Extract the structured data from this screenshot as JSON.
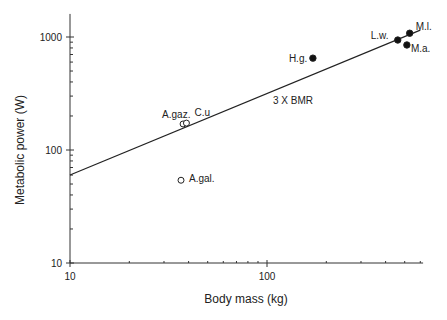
{
  "chart_data": {
    "type": "scatter",
    "title": "",
    "xlabel": "Body mass (kg)",
    "ylabel": "Metabolic power (W)",
    "xscale": "log",
    "yscale": "log",
    "xlim": [
      10,
      620
    ],
    "ylim": [
      10,
      1600
    ],
    "x_ticks": [
      10,
      100
    ],
    "y_ticks": [
      10,
      100,
      1000
    ],
    "x_tick_labels": [
      "10",
      "100"
    ],
    "y_tick_labels": [
      "10",
      "100",
      "1000"
    ],
    "grid": false,
    "series": [
      {
        "name": "open",
        "marker": "open-circle",
        "points": [
          {
            "label": "A.gaz.",
            "x": 37.5,
            "y": 170
          },
          {
            "label": "C.u",
            "x": 39,
            "y": 173
          },
          {
            "label": "A.gal.",
            "x": 36.6,
            "y": 54
          }
        ]
      },
      {
        "name": "filled",
        "marker": "filled-circle",
        "points": [
          {
            "label": "H.g.",
            "x": 171,
            "y": 650
          },
          {
            "label": "L.w.",
            "x": 461,
            "y": 940
          },
          {
            "label": "M.a.",
            "x": 513,
            "y": 850
          },
          {
            "label": "M.l.",
            "x": 530,
            "y": 1080
          }
        ]
      }
    ],
    "reference_line": {
      "label": "3 X BMR",
      "points": [
        {
          "x": 10,
          "y": 60
        },
        {
          "x": 600,
          "y": 1150
        }
      ]
    },
    "annotations": [
      "3 X BMR"
    ]
  }
}
